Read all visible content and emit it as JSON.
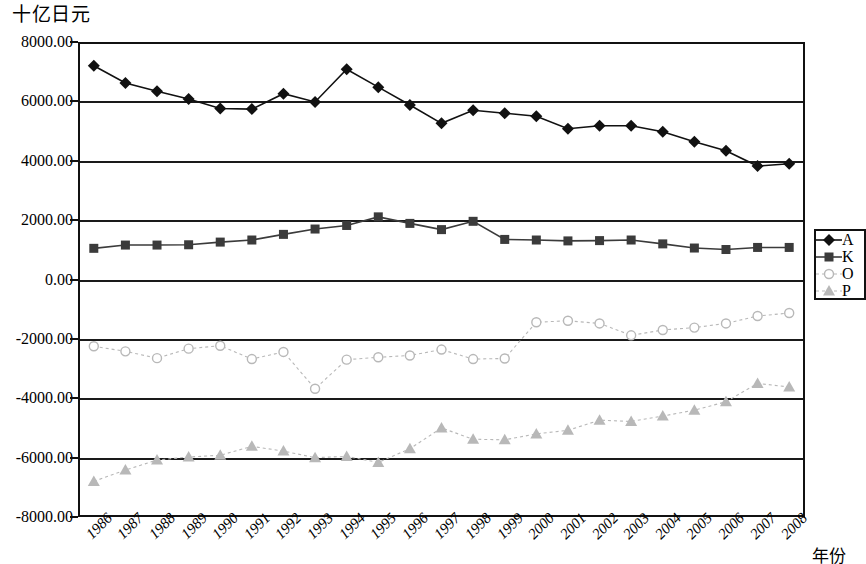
{
  "chart_data": {
    "type": "line",
    "title": "十亿日元",
    "xlabel": "年份",
    "ylabel": "十亿日元",
    "grid": true,
    "legend_position": "right",
    "ylim": [
      -8000,
      8000
    ],
    "ytick_labels": [
      "8000.00",
      "6000.00",
      "4000.00",
      "2000.00",
      "0.00",
      "-2000.00",
      "-4000.00",
      "-6000.00",
      "-8000.00"
    ],
    "ytick_values": [
      8000,
      6000,
      4000,
      2000,
      0,
      -2000,
      -4000,
      -6000,
      -8000
    ],
    "categories": [
      "1986",
      "1987",
      "1988",
      "1989",
      "1990",
      "1991",
      "1992",
      "1993",
      "1994",
      "1995",
      "1996",
      "1997",
      "1998",
      "1999",
      "2000",
      "2001",
      "2002",
      "2003",
      "2004",
      "2005",
      "2006",
      "2007",
      "2008"
    ],
    "series": [
      {
        "name": "A",
        "marker": "diamond",
        "color": "#111111",
        "values": [
          7200,
          6620,
          6340,
          6080,
          5760,
          5740,
          6260,
          5980,
          7080,
          6480,
          5880,
          5260,
          5700,
          5600,
          5500,
          5080,
          5180,
          5180,
          4980,
          4640,
          4340,
          3820,
          3900
        ]
      },
      {
        "name": "K",
        "marker": "square",
        "color": "#3b3b3b",
        "values": [
          1050,
          1160,
          1160,
          1170,
          1260,
          1330,
          1520,
          1700,
          1820,
          2110,
          1890,
          1680,
          1960,
          1350,
          1330,
          1300,
          1310,
          1330,
          1200,
          1060,
          1010,
          1080,
          1080
        ]
      },
      {
        "name": "O",
        "marker": "circle",
        "color": "#b8b8b8",
        "values": [
          -2250,
          -2420,
          -2650,
          -2330,
          -2230,
          -2680,
          -2440,
          -3680,
          -2700,
          -2620,
          -2560,
          -2360,
          -2680,
          -2660,
          -1440,
          -1390,
          -1480,
          -1880,
          -1700,
          -1620,
          -1480,
          -1230,
          -1130
        ]
      },
      {
        "name": "P",
        "marker": "triangle",
        "color": "#b8b8b8",
        "values": [
          -6800,
          -6420,
          -6080,
          -5980,
          -5920,
          -5620,
          -5780,
          -6000,
          -5960,
          -6160,
          -5700,
          -5000,
          -5380,
          -5400,
          -5200,
          -5080,
          -4740,
          -4780,
          -4600,
          -4400,
          -4120,
          -3500,
          -3620
        ]
      }
    ]
  },
  "legend": {
    "items": [
      {
        "label": "A"
      },
      {
        "label": "K"
      },
      {
        "label": "O"
      },
      {
        "label": "P"
      }
    ]
  }
}
